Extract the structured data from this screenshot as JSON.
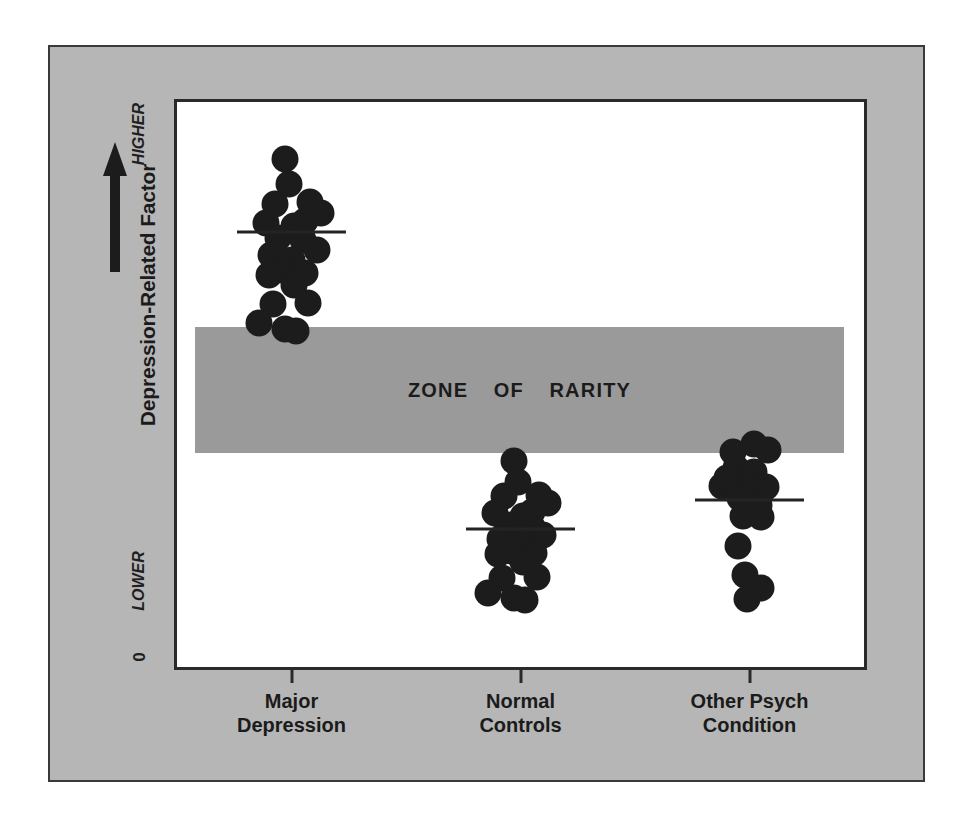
{
  "figure": {
    "y_axis_title": "Depression-Related Factor",
    "y_axis_high_label": "HIGHER",
    "y_axis_low_label": "LOWER",
    "y_axis_zero_label": "0",
    "zone_band_label": "ZONE  OF  RARITY",
    "arrow_icon": "up-arrow-icon",
    "colors": {
      "panel_background": "#b6b6b6",
      "plot_background": "#ffffff",
      "frame_border": "#2a2a2a",
      "zone_band": "#9a9a9a",
      "dot": "#1c1c1c",
      "mean_line": "#242424",
      "text": "#1b1b1b"
    }
  },
  "chart_data": {
    "type": "scatter",
    "title": "",
    "subtitle": "",
    "xlabel": "",
    "ylabel": "Depression-Related Factor",
    "ylim": [
      0,
      100
    ],
    "ytick_labels": [
      "0",
      "LOWER",
      "HIGHER"
    ],
    "grid": false,
    "legend": "none",
    "annotations": [
      {
        "text": "ZONE  OF  RARITY",
        "kind": "band",
        "y_range": [
          39,
          61
        ],
        "description": "Shaded horizontal band separating the high-scoring Major Depression group from the two low-scoring groups"
      }
    ],
    "categories": [
      "Major Depression",
      "Normal Controls",
      "Other Psych Condition"
    ],
    "series": [
      {
        "name": "Major Depression",
        "x_center": 1,
        "mean": 77.0,
        "mean_line_x_range": [
          0.76,
          1.24
        ],
        "n": 22,
        "points": [
          {
            "x": 0.97,
            "y": 90.0
          },
          {
            "x": 0.99,
            "y": 85.5
          },
          {
            "x": 0.93,
            "y": 82.0
          },
          {
            "x": 1.08,
            "y": 82.3
          },
          {
            "x": 1.13,
            "y": 80.3
          },
          {
            "x": 0.89,
            "y": 78.6
          },
          {
            "x": 1.01,
            "y": 78.1
          },
          {
            "x": 0.94,
            "y": 76.0
          },
          {
            "x": 1.05,
            "y": 75.6
          },
          {
            "x": 1.11,
            "y": 73.8
          },
          {
            "x": 0.91,
            "y": 72.9
          },
          {
            "x": 1.0,
            "y": 72.0
          },
          {
            "x": 0.96,
            "y": 70.2
          },
          {
            "x": 1.06,
            "y": 69.8
          },
          {
            "x": 1.01,
            "y": 67.6
          },
          {
            "x": 0.92,
            "y": 64.2
          },
          {
            "x": 1.07,
            "y": 64.5
          },
          {
            "x": 0.86,
            "y": 60.9
          },
          {
            "x": 0.97,
            "y": 59.8
          },
          {
            "x": 1.02,
            "y": 59.4
          },
          {
            "x": 1.06,
            "y": 78.9
          },
          {
            "x": 0.9,
            "y": 69.4
          }
        ]
      },
      {
        "name": "Normal Controls",
        "x_center": 2,
        "mean": 24.5,
        "mean_line_x_range": [
          1.76,
          2.24
        ],
        "n": 22,
        "points": [
          {
            "x": 1.97,
            "y": 36.5
          },
          {
            "x": 1.99,
            "y": 32.8
          },
          {
            "x": 1.93,
            "y": 30.2
          },
          {
            "x": 2.08,
            "y": 30.4
          },
          {
            "x": 2.12,
            "y": 29.0
          },
          {
            "x": 1.89,
            "y": 27.3
          },
          {
            "x": 2.01,
            "y": 26.8
          },
          {
            "x": 1.94,
            "y": 25.1
          },
          {
            "x": 2.05,
            "y": 24.8
          },
          {
            "x": 2.1,
            "y": 23.4
          },
          {
            "x": 1.91,
            "y": 22.6
          },
          {
            "x": 2.0,
            "y": 21.9
          },
          {
            "x": 1.96,
            "y": 20.5
          },
          {
            "x": 2.06,
            "y": 20.2
          },
          {
            "x": 2.01,
            "y": 18.5
          },
          {
            "x": 1.92,
            "y": 15.8
          },
          {
            "x": 2.07,
            "y": 16.0
          },
          {
            "x": 1.86,
            "y": 13.1
          },
          {
            "x": 1.97,
            "y": 12.2
          },
          {
            "x": 2.02,
            "y": 11.9
          },
          {
            "x": 2.05,
            "y": 27.5
          },
          {
            "x": 1.9,
            "y": 20.0
          }
        ]
      },
      {
        "name": "Other Psych Condition",
        "x_center": 3,
        "mean": 29.5,
        "mean_line_x_range": [
          2.76,
          3.24
        ],
        "n": 17,
        "points": [
          {
            "x": 3.02,
            "y": 39.5
          },
          {
            "x": 2.93,
            "y": 38.0
          },
          {
            "x": 3.08,
            "y": 38.4
          },
          {
            "x": 2.94,
            "y": 35.2
          },
          {
            "x": 3.02,
            "y": 34.6
          },
          {
            "x": 2.88,
            "y": 32.1
          },
          {
            "x": 3.0,
            "y": 31.6
          },
          {
            "x": 3.07,
            "y": 31.8
          },
          {
            "x": 2.96,
            "y": 30.0
          },
          {
            "x": 3.04,
            "y": 28.6
          },
          {
            "x": 2.97,
            "y": 26.8
          },
          {
            "x": 3.05,
            "y": 26.5
          },
          {
            "x": 2.95,
            "y": 21.4
          },
          {
            "x": 2.98,
            "y": 16.2
          },
          {
            "x": 3.05,
            "y": 14.0
          },
          {
            "x": 2.99,
            "y": 12.0
          },
          {
            "x": 2.9,
            "y": 33.4
          }
        ]
      }
    ]
  }
}
